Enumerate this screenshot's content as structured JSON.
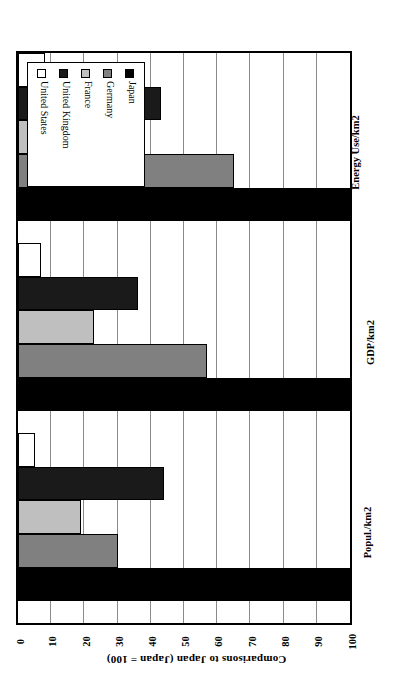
{
  "chart_data": {
    "type": "bar",
    "orientation": "horizontal",
    "title": "",
    "xlabel": "Comparisons to Japan (Japan = 100)",
    "ylabel": "",
    "categories": [
      "Popul./km2",
      "GDP/km2",
      "Energy Use/km2"
    ],
    "series": [
      {
        "name": "Japan",
        "values": [
          100,
          100,
          100
        ],
        "color": "#000000"
      },
      {
        "name": "Germany",
        "values": [
          30,
          57,
          65
        ],
        "color": "#808080"
      },
      {
        "name": "France",
        "values": [
          19,
          23,
          23
        ],
        "color": "#bfbfbf"
      },
      {
        "name": "United Kingdom",
        "values": [
          44,
          36,
          43
        ],
        "color": "#1a1a1a"
      },
      {
        "name": "United States",
        "values": [
          5,
          7,
          8
        ],
        "color": "#ffffff"
      }
    ],
    "xlim": [
      0,
      100
    ],
    "xticks": [
      "0",
      "10",
      "20",
      "30",
      "40",
      "50",
      "60",
      "70",
      "80",
      "90",
      "100"
    ],
    "grid": true,
    "legend_position": "top-left"
  },
  "legend": {
    "entries": [
      "Japan",
      "Germany",
      "France",
      "United Kingdom",
      "United States"
    ]
  },
  "axis": {
    "title": "Comparisons to Japan (Japan = 100)"
  }
}
